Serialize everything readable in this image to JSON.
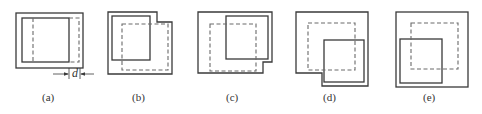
{
  "figure": {
    "panels": [
      {
        "id": "a",
        "label": "(a)",
        "dimension_label": "d"
      },
      {
        "id": "b",
        "label": "(b)"
      },
      {
        "id": "c",
        "label": "(c)"
      },
      {
        "id": "d",
        "label": "(d)"
      },
      {
        "id": "e",
        "label": "(e)"
      }
    ],
    "colors": {
      "line": "#3a3a3a",
      "dashed": "#6a6a6a",
      "background": "#ffffff"
    }
  }
}
